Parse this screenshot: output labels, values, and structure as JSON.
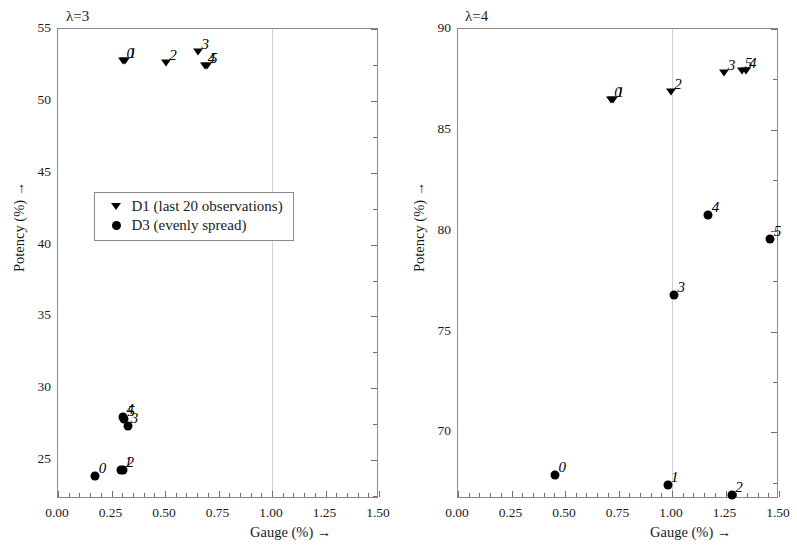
{
  "figure": {
    "panels": [
      {
        "id": "left",
        "label": "λ=3",
        "xlabel": "Gauge (%) →",
        "ylabel": "Potency (%) →",
        "xlim": [
          0.0,
          1.5
        ],
        "ylim": [
          22.3,
          55.0
        ],
        "xticks": [
          "0.00",
          "0.25",
          "0.50",
          "0.75",
          "1.00",
          "1.25",
          "1.50"
        ],
        "xtickvals": [
          0.0,
          0.25,
          0.5,
          0.75,
          1.0,
          1.25,
          1.5
        ],
        "yticks": [
          "25",
          "30",
          "35",
          "40",
          "45",
          "50",
          "55"
        ],
        "ytickvals": [
          25,
          30,
          35,
          40,
          45,
          50,
          55
        ],
        "gridline_x": 1.0
      },
      {
        "id": "right",
        "label": "λ=4",
        "xlabel": "Gauge (%) →",
        "ylabel": "Potency (%) →",
        "xlim": [
          0.0,
          1.5
        ],
        "ylim": [
          66.7,
          90.0
        ],
        "xticks": [
          "0.00",
          "0.25",
          "0.50",
          "0.75",
          "1.00",
          "1.25",
          "1.50"
        ],
        "xtickvals": [
          0.0,
          0.25,
          0.5,
          0.75,
          1.0,
          1.25,
          1.5
        ],
        "yticks": [
          "70",
          "75",
          "80",
          "85",
          "90"
        ],
        "ytickvals": [
          70,
          75,
          80,
          85,
          90
        ],
        "gridline_x": 1.0
      }
    ]
  },
  "legend": {
    "position": "center-left of left panel",
    "entries": [
      {
        "marker": "triangle",
        "label": "D1 (last 20 observations)"
      },
      {
        "marker": "circle",
        "label": "D3 (evenly spread)"
      }
    ]
  },
  "chart_data": [
    {
      "type": "scatter",
      "panel": "left",
      "title": "λ=3",
      "xlabel": "Gauge (%) →",
      "ylabel": "Potency (%) →",
      "xlim": [
        0.0,
        1.5
      ],
      "ylim": [
        22.3,
        55.0
      ],
      "grid": false,
      "gridline_x": 1.0,
      "legend_position": "center-left",
      "series": [
        {
          "name": "D1 (last 20 observations)",
          "marker": "triangle",
          "point_labels": [
            "0",
            "1",
            "2",
            "3",
            "4",
            "5"
          ],
          "x": [
            0.305,
            0.315,
            0.505,
            0.655,
            0.685,
            0.695
          ],
          "y": [
            52.8,
            52.8,
            52.6,
            53.4,
            52.4,
            52.4
          ]
        },
        {
          "name": "D3 (evenly spread)",
          "marker": "circle",
          "point_labels": [
            "0",
            "1",
            "2",
            "3",
            "4",
            "5"
          ],
          "x": [
            0.175,
            0.295,
            0.305,
            0.325,
            0.305,
            0.31
          ],
          "y": [
            23.9,
            24.3,
            24.3,
            27.4,
            28.0,
            27.9
          ]
        }
      ]
    },
    {
      "type": "scatter",
      "panel": "right",
      "title": "λ=4",
      "xlabel": "Gauge (%) →",
      "ylabel": "Potency (%) →",
      "xlim": [
        0.0,
        1.5
      ],
      "ylim": [
        66.7,
        90.0
      ],
      "grid": false,
      "gridline_x": 1.0,
      "legend_position": "none",
      "series": [
        {
          "name": "D1 (last 20 observations)",
          "marker": "triangle",
          "point_labels": [
            "0",
            "1",
            "2",
            "3",
            "4",
            "5"
          ],
          "x": [
            0.715,
            0.725,
            0.995,
            1.245,
            1.345,
            1.325
          ],
          "y": [
            86.5,
            86.5,
            86.9,
            87.8,
            87.9,
            87.9
          ]
        },
        {
          "name": "D3 (evenly spread)",
          "marker": "circle",
          "point_labels": [
            "0",
            "1",
            "2",
            "3",
            "4",
            "5"
          ],
          "x": [
            0.455,
            0.98,
            1.28,
            1.01,
            1.17,
            1.46
          ],
          "y": [
            67.9,
            67.4,
            66.9,
            76.8,
            80.8,
            79.6
          ]
        }
      ]
    }
  ]
}
